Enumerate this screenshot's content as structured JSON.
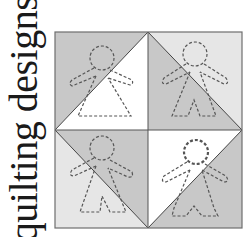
{
  "title": "quilting designs",
  "colors": {
    "background": "#ffffff",
    "dark_fabric": "#c8c8c8",
    "light_fabric": "#e6e6e6",
    "white_fabric": "#ffffff",
    "border": "#6e6e6e",
    "stitch": "#555555"
  },
  "blocks": [
    {
      "position": "top-left",
      "triangles": [
        "dark",
        "white"
      ],
      "figure": "child-in-dress"
    },
    {
      "position": "top-right",
      "triangles": [
        "light",
        "dark"
      ],
      "figure": "child-in-pants"
    },
    {
      "position": "bottom-left",
      "triangles": [
        "light",
        "dark"
      ],
      "figure": "child-in-dress"
    },
    {
      "position": "bottom-right",
      "triangles": [
        "white",
        "dark"
      ],
      "figure": "child-with-curly-hair"
    }
  ]
}
